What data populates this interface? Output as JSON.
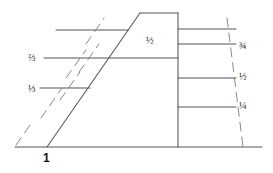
{
  "figure": {
    "background_color": "#ffffff",
    "line_color": "#55555a",
    "dash_color": "#7a7a80",
    "text_color": "#2b2b2b",
    "width": 273,
    "height": 173
  },
  "labels": {
    "left": [
      {
        "text": "⅔",
        "x": 28,
        "y": 53
      },
      {
        "text": "⅓",
        "x": 28,
        "y": 84
      }
    ],
    "center": [
      {
        "text": "½",
        "x": 146,
        "y": 36
      }
    ],
    "right": [
      {
        "text": "¾",
        "x": 239,
        "y": 41
      },
      {
        "text": "½",
        "x": 239,
        "y": 72
      },
      {
        "text": "¼",
        "x": 239,
        "y": 101
      }
    ],
    "base": [
      {
        "text": "1",
        "x": 43,
        "y": 152
      }
    ]
  },
  "chart_data": {
    "type": "line",
    "xlabel": "",
    "ylabel": "",
    "grid": false,
    "legend": null,
    "annotations": [
      "⅔",
      "⅓",
      "½",
      "¾",
      "½",
      "¼",
      "1"
    ],
    "outline": {
      "name": "embankment-outline",
      "points": [
        [
          15,
          147
        ],
        [
          47,
          147
        ],
        [
          140,
          13
        ],
        [
          178,
          13
        ],
        [
          178,
          147
        ],
        [
          262,
          147
        ]
      ]
    },
    "series": [
      {
        "name": "baseline",
        "type": "solid",
        "points": [
          [
            15,
            147
          ],
          [
            262,
            147
          ]
        ]
      },
      {
        "name": "front-slope",
        "type": "solid",
        "points": [
          [
            47,
            147
          ],
          [
            140,
            13
          ]
        ]
      },
      {
        "name": "crest",
        "type": "solid",
        "points": [
          [
            140,
            13
          ],
          [
            178,
            13
          ]
        ]
      },
      {
        "name": "back-face",
        "type": "solid",
        "points": [
          [
            178,
            13
          ],
          [
            178,
            147
          ]
        ]
      },
      {
        "name": "reference-line-top",
        "type": "solid",
        "points": [
          [
            56,
            30
          ],
          [
            128,
            30
          ]
        ]
      },
      {
        "name": "reference-line-two-thirds",
        "type": "solid",
        "points": [
          [
            44,
            58
          ],
          [
            178,
            58
          ]
        ]
      },
      {
        "name": "reference-line-one-third",
        "type": "solid",
        "points": [
          [
            40,
            88
          ],
          [
            90,
            88
          ]
        ]
      },
      {
        "name": "right-tick-upper",
        "type": "solid",
        "points": [
          [
            178,
            29
          ],
          [
            236,
            29
          ]
        ]
      },
      {
        "name": "right-tick-three-quarters",
        "type": "solid",
        "points": [
          [
            178,
            44
          ],
          [
            236,
            44
          ]
        ]
      },
      {
        "name": "right-tick-half",
        "type": "solid",
        "points": [
          [
            178,
            78
          ],
          [
            236,
            78
          ]
        ]
      },
      {
        "name": "right-tick-quarter",
        "type": "solid",
        "points": [
          [
            178,
            107
          ],
          [
            236,
            107
          ]
        ]
      },
      {
        "name": "dash-slope-a",
        "type": "dashed",
        "points": [
          [
            16,
            145
          ],
          [
            30,
            125
          ]
        ]
      },
      {
        "name": "dash-slope-b",
        "type": "dashed",
        "points": [
          [
            41,
            118
          ],
          [
            62,
            88
          ]
        ]
      },
      {
        "name": "dash-slope-c",
        "type": "dashed",
        "points": [
          [
            60,
            100
          ],
          [
            80,
            72
          ]
        ]
      },
      {
        "name": "dash-slope-d",
        "type": "dashed",
        "points": [
          [
            66,
            78
          ],
          [
            86,
            50
          ]
        ]
      },
      {
        "name": "dash-slope-e",
        "type": "dashed",
        "points": [
          [
            79,
            72
          ],
          [
            99,
            44
          ]
        ]
      },
      {
        "name": "dash-slope-f",
        "type": "dashed",
        "points": [
          [
            86,
            44
          ],
          [
            104,
            18
          ]
        ]
      },
      {
        "name": "dash-slope-right",
        "type": "dashed",
        "points": [
          [
            227,
            18
          ],
          [
            243,
            147
          ]
        ]
      }
    ]
  }
}
